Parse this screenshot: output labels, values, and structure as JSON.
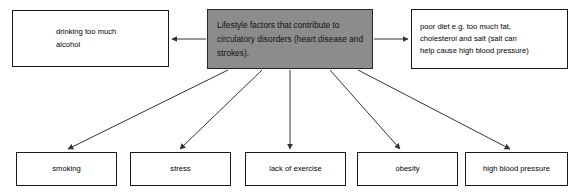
{
  "diagram": {
    "title": "Lifestyle factors that contribute to circulatory disorders",
    "center": {
      "label": "Lifestyle factors that contribute to circulatory disorders (heart disease and strokes).",
      "fill_color": "#8c8c8c",
      "border_color": "#262626"
    },
    "nodes": {
      "alcohol": "drinking too much\nalcohol",
      "diet": "poor diet e.g. too much fat,\ncholesterol and salt (salt can\nhelp cause high blood pressure)",
      "smoking": "smoking",
      "stress": "stress",
      "exercise": "lack of exercise",
      "obesity": "obesity",
      "blood_pressure": "high blood pressure"
    },
    "connector_color": "#333333",
    "node_fill": "#ffffff",
    "node_border": "#1a1a1a"
  }
}
